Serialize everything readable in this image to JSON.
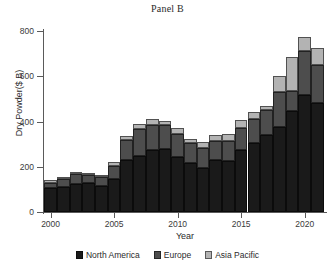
{
  "chart_data": {
    "type": "bar",
    "title": "Panel B",
    "xlabel": "Year",
    "ylabel": "Dry Powder($ B)",
    "stacked": true,
    "grid": false,
    "legend_position": "bottom",
    "ylim": [
      0,
      800
    ],
    "yticks": [
      0,
      200,
      400,
      600,
      800
    ],
    "ytick_labels": [
      "0",
      "200",
      "400",
      "600",
      "800"
    ],
    "xlim": [
      1999.4,
      2021.6
    ],
    "xticks": [
      2000,
      2005,
      2010,
      2015,
      2020
    ],
    "xtick_labels": [
      "2000",
      "2005",
      "2010",
      "2015",
      "2020"
    ],
    "categories": [
      2000,
      2001,
      2002,
      2003,
      2004,
      2005,
      2006,
      2007,
      2008,
      2009,
      2010,
      2011,
      2012,
      2013,
      2014,
      2015,
      2016,
      2017,
      2018,
      2019,
      2020,
      2021
    ],
    "series": [
      {
        "name": "North America",
        "color": "#1a1a1a",
        "values": [
          105,
          110,
          125,
          128,
          115,
          145,
          228,
          248,
          275,
          278,
          242,
          215,
          195,
          232,
          225,
          275,
          305,
          340,
          375,
          445,
          518,
          480
        ]
      },
      {
        "name": "Europe",
        "color": "#4d4d4d",
        "values": [
          25,
          35,
          45,
          37,
          40,
          60,
          90,
          118,
          110,
          105,
          105,
          88,
          90,
          80,
          90,
          95,
          105,
          110,
          155,
          88,
          192,
          170
        ]
      },
      {
        "name": "Asia Pacific",
        "color": "#b3b3b3",
        "values": [
          10,
          8,
          8,
          7,
          8,
          15,
          18,
          22,
          25,
          18,
          23,
          20,
          25,
          30,
          30,
          35,
          30,
          18,
          70,
          150,
          65,
          75
        ]
      }
    ],
    "totals": [
      140,
      153,
      178,
      172,
      163,
      220,
      336,
      388,
      410,
      401,
      370,
      323,
      310,
      342,
      345,
      405,
      440,
      468,
      600,
      683,
      775,
      725
    ]
  }
}
